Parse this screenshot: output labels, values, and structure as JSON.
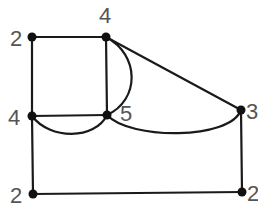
{
  "graph": {
    "nodes": [
      {
        "id": "A",
        "label": "2",
        "x": 32,
        "y": 37
      },
      {
        "id": "B",
        "label": "4",
        "x": 106,
        "y": 37
      },
      {
        "id": "C",
        "label": "4",
        "x": 32,
        "y": 116
      },
      {
        "id": "D",
        "label": "5",
        "x": 107,
        "y": 115
      },
      {
        "id": "E",
        "label": "3",
        "x": 241,
        "y": 110
      },
      {
        "id": "F",
        "label": "2",
        "x": 33,
        "y": 194
      },
      {
        "id": "G",
        "label": "2",
        "x": 242,
        "y": 192
      }
    ],
    "edges": [
      {
        "from": "A",
        "to": "B",
        "type": "straight"
      },
      {
        "from": "A",
        "to": "C",
        "type": "straight"
      },
      {
        "from": "B",
        "to": "D",
        "type": "straight"
      },
      {
        "from": "B",
        "to": "D",
        "type": "curved"
      },
      {
        "from": "B",
        "to": "E",
        "type": "straight"
      },
      {
        "from": "C",
        "to": "D",
        "type": "straight"
      },
      {
        "from": "C",
        "to": "D",
        "type": "curved"
      },
      {
        "from": "D",
        "to": "E",
        "type": "curved"
      },
      {
        "from": "C",
        "to": "F",
        "type": "straight"
      },
      {
        "from": "F",
        "to": "G",
        "type": "straight"
      },
      {
        "from": "E",
        "to": "G",
        "type": "straight"
      }
    ]
  },
  "labels": {
    "A": "2",
    "B": "4",
    "C": "4",
    "D": "5",
    "E": "3",
    "F": "2",
    "G": "2"
  }
}
